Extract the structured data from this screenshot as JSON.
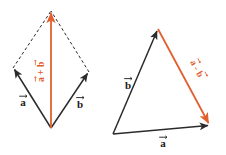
{
  "figure": {
    "background_color": "#ffffff",
    "colors": {
      "vector_black": "#2b2b2b",
      "vector_orange": "#e2602f",
      "dashed_line": "#2b2b2b",
      "label_black": "#1a1a1a",
      "label_orange": "#e2602f"
    },
    "width": 226,
    "height": 155
  },
  "diagram_left": {
    "name": "parallelogram-rule-addition",
    "labels": {
      "vector_a": "a",
      "vector_b": "b",
      "resultant_base": "a + b",
      "resultant_term_1": "a",
      "resultant_operator": "+",
      "resultant_term_2": "b"
    },
    "geometry": {
      "origin": [
        51,
        128
      ],
      "tip_a": [
        13,
        68
      ],
      "tip_b": [
        89,
        72
      ],
      "apex": [
        51,
        11
      ]
    },
    "style": {
      "solid_edges": [
        "origin-to-tip_a",
        "origin-to-tip_b"
      ],
      "dashed_edges": [
        "tip_a-to-apex",
        "tip_b-to-apex"
      ],
      "resultant_color": "#e2602f"
    }
  },
  "diagram_right": {
    "name": "triangle-rule-subtraction",
    "labels": {
      "vector_a": "a",
      "vector_b": "b",
      "resultant_base": "a - b",
      "resultant_term_1": "a",
      "resultant_operator": "−",
      "resultant_term_2": "b"
    },
    "geometry": {
      "origin": [
        113,
        134
      ],
      "apex": [
        158,
        29
      ],
      "tip_a": [
        210,
        125
      ]
    },
    "style": {
      "solid_edges": [
        "origin-to-apex",
        "origin-to-tip_a"
      ],
      "resultant_edge": "apex-to-tip_a",
      "resultant_color": "#e2602f"
    }
  }
}
